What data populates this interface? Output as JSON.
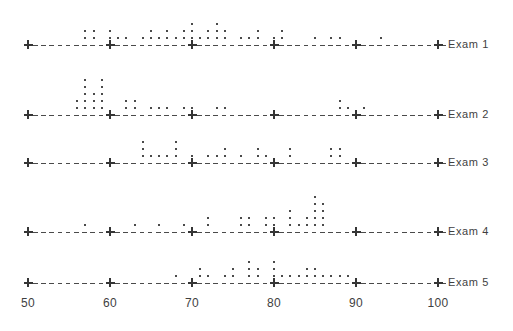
{
  "chart_data": {
    "type": "scatter",
    "title": "",
    "xlabel": "",
    "ylabel": "",
    "xlim": [
      50,
      100
    ],
    "grid": false,
    "legend_position": "right",
    "x_ticks": [
      50,
      60,
      70,
      80,
      90,
      100
    ],
    "x_tick_labels": [
      "50",
      "60",
      "70",
      "80",
      "90",
      "100"
    ],
    "series": [
      {
        "name": "Exam 1",
        "label": "Exam 1",
        "baseline_y": 45,
        "stacks": [
          {
            "x": 57,
            "count": 2
          },
          {
            "x": 58,
            "count": 2
          },
          {
            "x": 60,
            "count": 2
          },
          {
            "x": 61,
            "count": 1
          },
          {
            "x": 62,
            "count": 1
          },
          {
            "x": 64,
            "count": 1
          },
          {
            "x": 65,
            "count": 2
          },
          {
            "x": 66,
            "count": 1
          },
          {
            "x": 67,
            "count": 2
          },
          {
            "x": 68,
            "count": 1
          },
          {
            "x": 69,
            "count": 2
          },
          {
            "x": 70,
            "count": 3
          },
          {
            "x": 71,
            "count": 1
          },
          {
            "x": 72,
            "count": 2
          },
          {
            "x": 73,
            "count": 3
          },
          {
            "x": 74,
            "count": 2
          },
          {
            "x": 76,
            "count": 1
          },
          {
            "x": 77,
            "count": 1
          },
          {
            "x": 78,
            "count": 2
          },
          {
            "x": 80,
            "count": 1
          },
          {
            "x": 81,
            "count": 2
          },
          {
            "x": 85,
            "count": 1
          },
          {
            "x": 87,
            "count": 1
          },
          {
            "x": 88,
            "count": 1
          },
          {
            "x": 93,
            "count": 1
          }
        ]
      },
      {
        "name": "Exam 2",
        "label": "Exam 2",
        "baseline_y": 115,
        "stacks": [
          {
            "x": 56,
            "count": 2
          },
          {
            "x": 57,
            "count": 5
          },
          {
            "x": 58,
            "count": 3
          },
          {
            "x": 59,
            "count": 5
          },
          {
            "x": 62,
            "count": 2
          },
          {
            "x": 63,
            "count": 2
          },
          {
            "x": 65,
            "count": 1
          },
          {
            "x": 66,
            "count": 1
          },
          {
            "x": 67,
            "count": 1
          },
          {
            "x": 69,
            "count": 1
          },
          {
            "x": 70,
            "count": 1
          },
          {
            "x": 73,
            "count": 1
          },
          {
            "x": 74,
            "count": 1
          },
          {
            "x": 88,
            "count": 2
          },
          {
            "x": 89,
            "count": 1
          },
          {
            "x": 91,
            "count": 1
          }
        ]
      },
      {
        "name": "Exam 3",
        "label": "Exam 3",
        "baseline_y": 163,
        "stacks": [
          {
            "x": 64,
            "count": 3
          },
          {
            "x": 65,
            "count": 1
          },
          {
            "x": 66,
            "count": 1
          },
          {
            "x": 67,
            "count": 1
          },
          {
            "x": 68,
            "count": 3
          },
          {
            "x": 70,
            "count": 1
          },
          {
            "x": 72,
            "count": 1
          },
          {
            "x": 73,
            "count": 1
          },
          {
            "x": 74,
            "count": 2
          },
          {
            "x": 76,
            "count": 1
          },
          {
            "x": 78,
            "count": 2
          },
          {
            "x": 79,
            "count": 1
          },
          {
            "x": 82,
            "count": 2
          },
          {
            "x": 87,
            "count": 2
          },
          {
            "x": 88,
            "count": 2
          }
        ]
      },
      {
        "name": "Exam 4",
        "label": "Exam 4",
        "baseline_y": 232,
        "stacks": [
          {
            "x": 57,
            "count": 1
          },
          {
            "x": 63,
            "count": 1
          },
          {
            "x": 66,
            "count": 1
          },
          {
            "x": 69,
            "count": 1
          },
          {
            "x": 72,
            "count": 2
          },
          {
            "x": 76,
            "count": 2
          },
          {
            "x": 77,
            "count": 2
          },
          {
            "x": 79,
            "count": 2
          },
          {
            "x": 80,
            "count": 2
          },
          {
            "x": 82,
            "count": 3
          },
          {
            "x": 83,
            "count": 1
          },
          {
            "x": 84,
            "count": 2
          },
          {
            "x": 85,
            "count": 5
          },
          {
            "x": 86,
            "count": 4
          }
        ]
      },
      {
        "name": "Exam 5",
        "label": "Exam 5",
        "baseline_y": 283,
        "stacks": [
          {
            "x": 68,
            "count": 1
          },
          {
            "x": 71,
            "count": 2
          },
          {
            "x": 72,
            "count": 1
          },
          {
            "x": 74,
            "count": 1
          },
          {
            "x": 75,
            "count": 2
          },
          {
            "x": 77,
            "count": 3
          },
          {
            "x": 78,
            "count": 2
          },
          {
            "x": 80,
            "count": 3
          },
          {
            "x": 81,
            "count": 1
          },
          {
            "x": 82,
            "count": 1
          },
          {
            "x": 83,
            "count": 1
          },
          {
            "x": 84,
            "count": 2
          },
          {
            "x": 85,
            "count": 2
          },
          {
            "x": 86,
            "count": 1
          },
          {
            "x": 87,
            "count": 1
          },
          {
            "x": 88,
            "count": 1
          },
          {
            "x": 89,
            "count": 1
          }
        ]
      }
    ]
  },
  "geometry": {
    "x_start_px": 28,
    "x_end_px": 438,
    "px_per_unit": 8.2,
    "dot_spacing_px": 7,
    "label_x_px": 448,
    "tick_label_y_px": 296
  },
  "colors": {
    "ink": "#4a4a4a",
    "text": "#3f3f3f",
    "background": "#ffffff"
  }
}
